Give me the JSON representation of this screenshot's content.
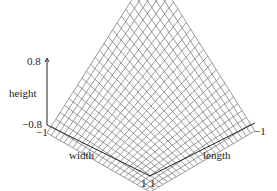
{
  "chart_data": {
    "type": "surface3d",
    "title": "",
    "xlabel": "length",
    "ylabel": "width",
    "zlabel": "height",
    "x_range": [
      -1,
      1
    ],
    "y_range": [
      -1,
      1
    ],
    "z_range": [
      -0.8,
      0.8
    ],
    "function": "height = -length * width (saddle surface)",
    "grid": {
      "rows": 24,
      "cols": 24
    },
    "tick_labels": {
      "z_top": "0.8",
      "z_bottom": "−0.8",
      "width_start": "−1",
      "width_end": "1",
      "length_start": "1",
      "length_end": "−1"
    }
  }
}
